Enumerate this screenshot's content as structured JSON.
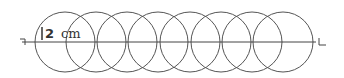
{
  "diagram": {
    "circle_count": 8,
    "radius_label_value": "2",
    "radius_label_unit": "cm",
    "line_start_marker": "┐",
    "line_end_marker": "L",
    "colors": {
      "stroke": "#555555",
      "line": "#444444",
      "text": "#333333",
      "background": "#ffffff"
    },
    "circles": [
      {
        "cx": 65,
        "cy": 42,
        "r": 30
      },
      {
        "cx": 96,
        "cy": 42,
        "r": 30
      },
      {
        "cx": 127,
        "cy": 42,
        "r": 30
      },
      {
        "cx": 158,
        "cy": 42,
        "r": 30
      },
      {
        "cx": 190,
        "cy": 42,
        "r": 30
      },
      {
        "cx": 221,
        "cy": 42,
        "r": 30
      },
      {
        "cx": 252,
        "cy": 42,
        "r": 30
      },
      {
        "cx": 283,
        "cy": 42,
        "r": 30
      }
    ],
    "line": {
      "x1": 22,
      "y1": 42,
      "x2": 316,
      "y2": 42
    }
  }
}
